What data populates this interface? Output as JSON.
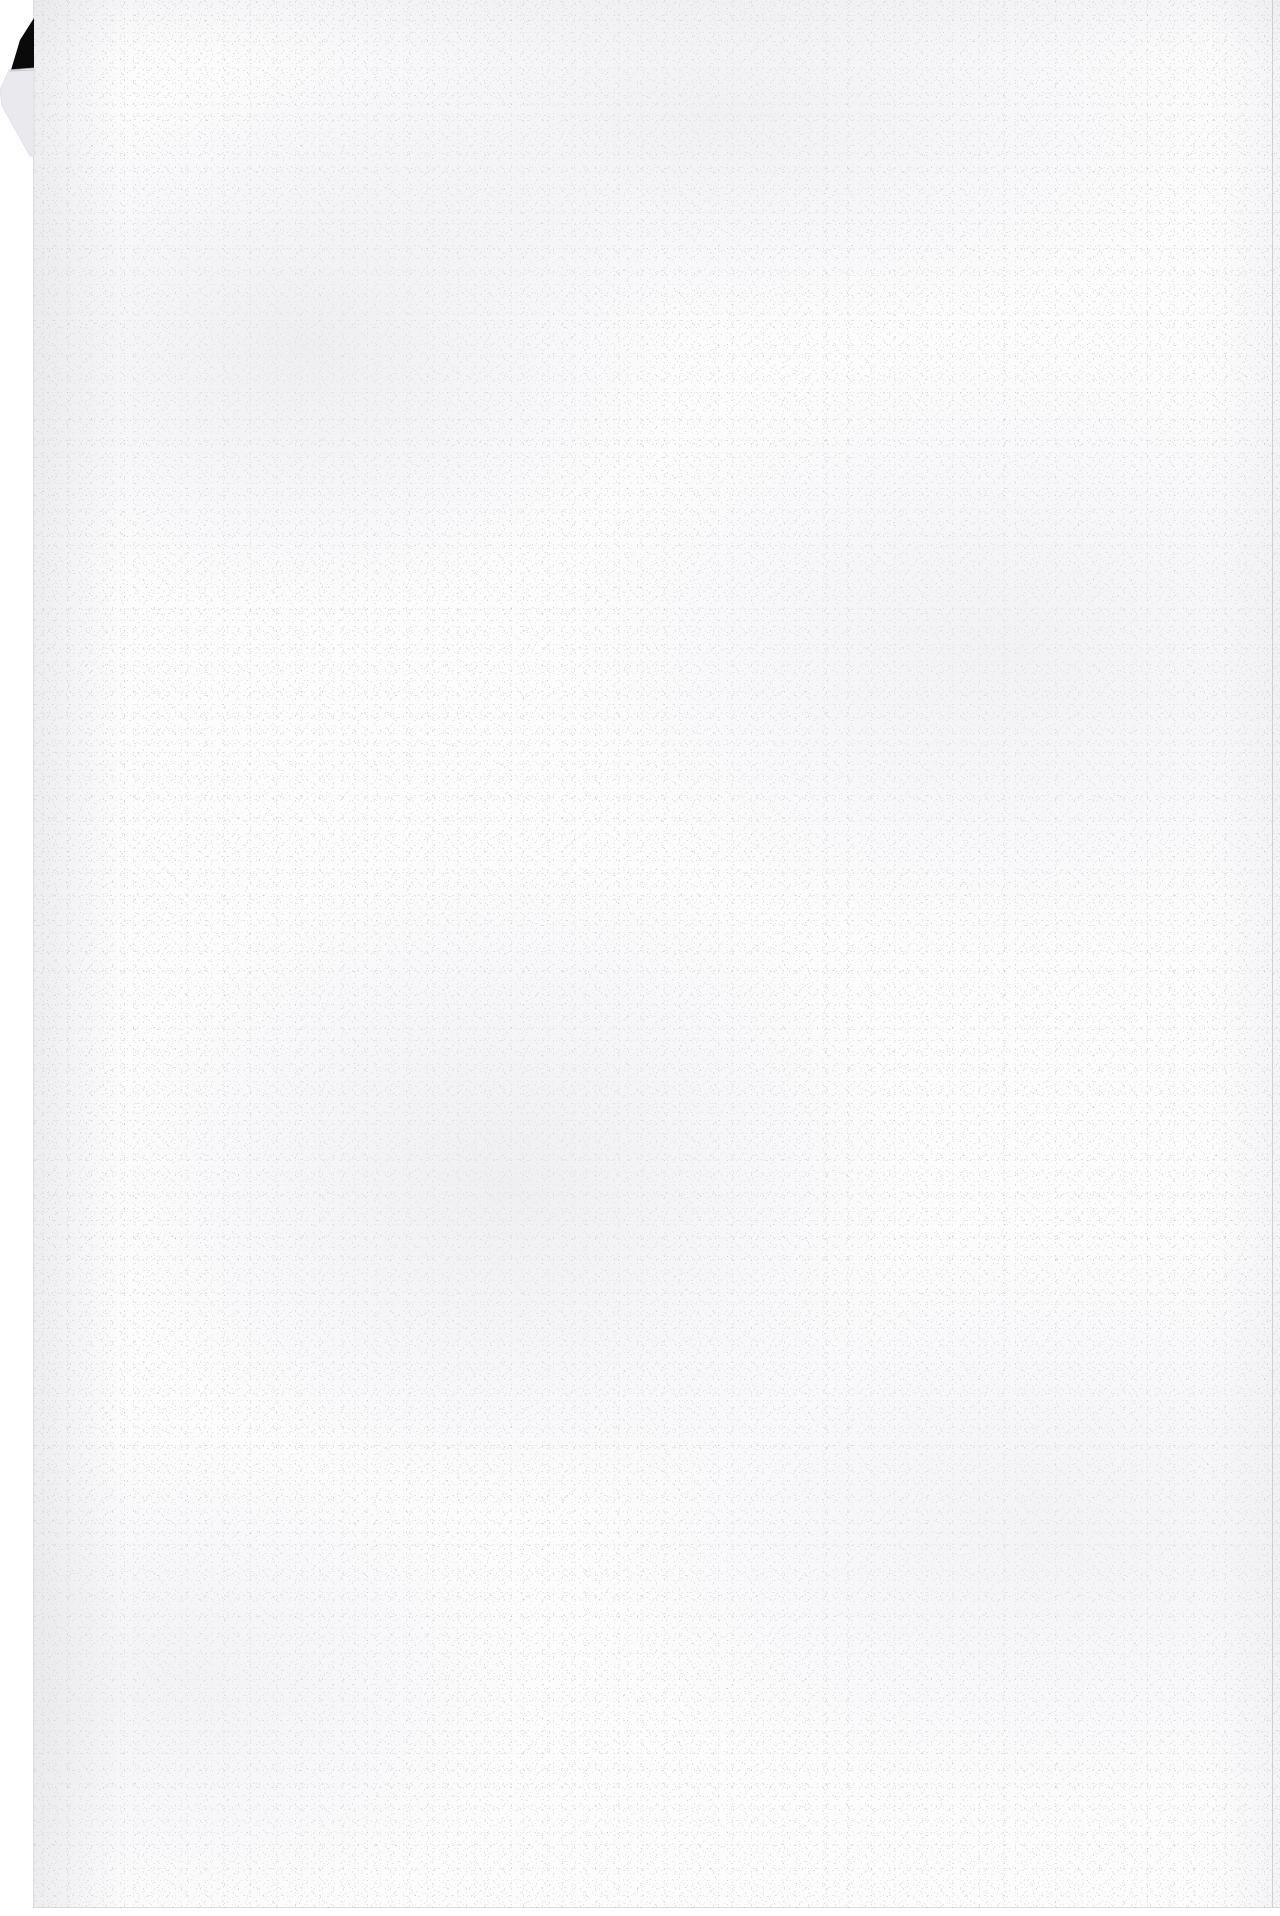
{
  "document": {
    "kind": "scanned-page-image",
    "page_content": "",
    "page_is_blank": true,
    "visible_text": "",
    "notes": ""
  },
  "scan": {
    "width_px": 1280,
    "height_px": 1916,
    "background_color": "#ffffff",
    "paper_color": "#fcfcfd",
    "grain_color": "#96969e",
    "mottle_color": "#e4e4e9"
  },
  "paper_sheet": {
    "left_px": 33,
    "top_px": 0,
    "width_px": 1247,
    "height_px": 1908,
    "label": ""
  },
  "margins": {
    "left_strip_width_px": 33,
    "bottom_strip_height_px": 8,
    "color": "#ffffff"
  },
  "corner_fold": {
    "position": "top-left",
    "shadow_color": "#0a0a0a",
    "fold_face_color": "#e9e9ec",
    "fold_edge_color": "#c8c8cf"
  },
  "edges": {
    "right_rule_color": "#b0b0b8",
    "bottom_rule_color": "#bebec6",
    "left_rule_color": "#c6c6cd"
  }
}
